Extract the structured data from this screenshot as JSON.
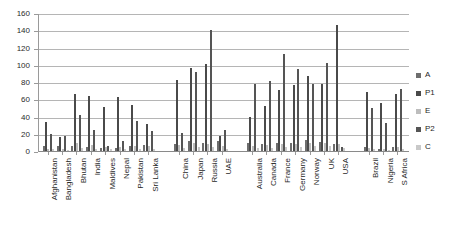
{
  "chart_data": {
    "type": "bar",
    "title": "",
    "subtitle": "",
    "xlabel": "",
    "ylabel": "",
    "ylim": [
      0,
      160
    ],
    "ytick_step": 20,
    "ytick_labels": [
      "0",
      "20",
      "40",
      "60",
      "80",
      "100",
      "120",
      "140",
      "160"
    ],
    "grid": true,
    "grid_axis": "y",
    "legend_position": "right",
    "categories": [
      "Afghanistan",
      "Bangladesh",
      "Bhutan",
      "India",
      "Maldives",
      "Nepal",
      "Pakistan",
      "Sri Lanka",
      "China",
      "Japan",
      "Russia",
      "UAE",
      "Australia",
      "Canada",
      "France",
      "Germany",
      "Norway",
      "UK",
      "USA",
      "Brazil",
      "Nigeria",
      "S Africa"
    ],
    "group_gaps_after": [
      "Sri Lanka",
      "UAE",
      "USA"
    ],
    "series": [
      {
        "name": "A",
        "color": "#6e6e6e",
        "values": [
          7,
          7,
          7,
          6,
          5,
          5,
          7,
          8,
          9,
          13,
          10,
          13,
          11,
          9,
          10,
          11,
          14,
          12,
          9,
          6,
          4,
          6
        ]
      },
      {
        "name": "P1",
        "color": "#4a4a4a",
        "values": [
          35,
          17,
          67,
          65,
          52,
          64,
          55,
          32,
          83,
          97,
          102,
          19,
          41,
          53,
          72,
          78,
          88,
          79,
          147,
          70,
          57,
          67
        ]
      },
      {
        "name": "E",
        "color": "#bdbdbd",
        "values": [
          4,
          3,
          10,
          8,
          6,
          6,
          7,
          7,
          8,
          10,
          9,
          7,
          7,
          8,
          9,
          9,
          10,
          10,
          9,
          5,
          4,
          6
        ]
      },
      {
        "name": "P2",
        "color": "#555555",
        "values": [
          21,
          18,
          43,
          26,
          7,
          13,
          36,
          24,
          22,
          93,
          142,
          26,
          79,
          82,
          114,
          96,
          79,
          103,
          6,
          51,
          34,
          73
        ]
      },
      {
        "name": "C",
        "color": "#c9c9c9",
        "values": [
          3,
          2,
          5,
          4,
          3,
          3,
          4,
          4,
          5,
          6,
          6,
          4,
          5,
          5,
          6,
          6,
          7,
          7,
          5,
          3,
          2,
          4
        ]
      }
    ]
  },
  "legend": {
    "items": [
      {
        "label": "A",
        "color": "#6e6e6e"
      },
      {
        "label": "P1",
        "color": "#4a4a4a"
      },
      {
        "label": "E",
        "color": "#bdbdbd"
      },
      {
        "label": "P2",
        "color": "#555555"
      },
      {
        "label": "C",
        "color": "#c9c9c9"
      }
    ]
  }
}
